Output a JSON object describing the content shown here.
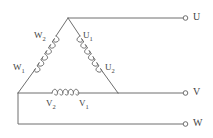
{
  "diagram": {
    "line_color": "#6e6e6e",
    "text_color": "#3f3f3f",
    "background": "#ffffff",
    "coils": [
      {
        "name": "coil-w2",
        "label_main": "W",
        "label_sub": "2"
      },
      {
        "name": "coil-u1",
        "label_main": "U",
        "label_sub": "1"
      },
      {
        "name": "coil-w1",
        "label_main": "W",
        "label_sub": "1"
      },
      {
        "name": "coil-u2",
        "label_main": "U",
        "label_sub": "2"
      },
      {
        "name": "coil-v2",
        "label_main": "V",
        "label_sub": "2"
      },
      {
        "name": "coil-v1",
        "label_main": "V",
        "label_sub": "1"
      }
    ],
    "terminals": [
      {
        "name": "terminal-u",
        "label": "U"
      },
      {
        "name": "terminal-v",
        "label": "V"
      },
      {
        "name": "terminal-w",
        "label": "W"
      }
    ]
  }
}
